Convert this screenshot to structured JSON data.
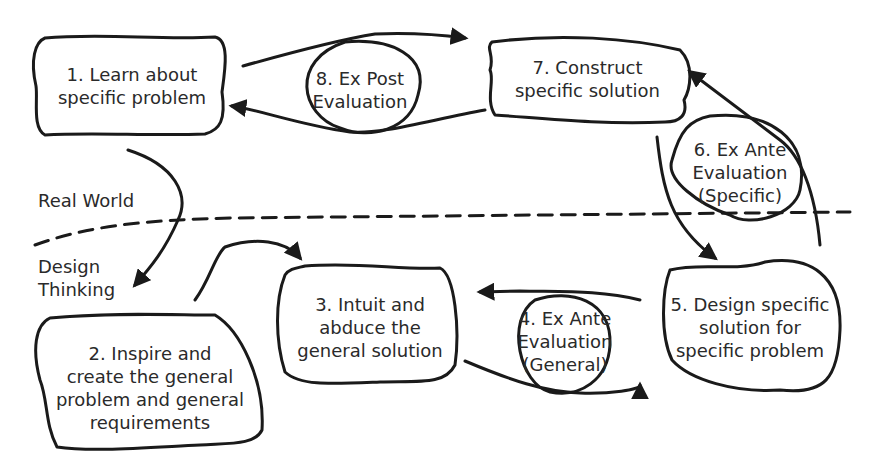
{
  "diagram": {
    "zones": {
      "upper": "Real World",
      "lower": "Design\nThinking"
    },
    "nodes": [
      {
        "id": "n1",
        "shape": "rounded-box",
        "label": "1. Learn about\nspecific problem"
      },
      {
        "id": "n2",
        "shape": "rounded-box",
        "label": "2. Inspire and\ncreate the general\nproblem and general\nrequirements"
      },
      {
        "id": "n3",
        "shape": "rounded-box",
        "label": "3. Intuit and\nabduce the\ngeneral solution"
      },
      {
        "id": "n4",
        "shape": "circle",
        "label": "4. Ex Ante\nEvaluation\n(General)"
      },
      {
        "id": "n5",
        "shape": "blob",
        "label": "5. Design specific\nsolution for\nspecific problem"
      },
      {
        "id": "n6",
        "shape": "circle",
        "label": "6. Ex Ante\nEvaluation\n(Specific)"
      },
      {
        "id": "n7",
        "shape": "rounded-box",
        "label": "7. Construct\nspecific solution"
      },
      {
        "id": "n8",
        "shape": "circle",
        "label": "8. Ex Post\nEvaluation"
      }
    ],
    "edges": [
      {
        "from": "n1",
        "to": "n2"
      },
      {
        "from": "n2",
        "to": "n3"
      },
      {
        "from": "n3",
        "to": "n5",
        "via": "n4"
      },
      {
        "from": "n5",
        "to": "n3",
        "via": "n4"
      },
      {
        "from": "n5",
        "to": "n7",
        "via": "n6"
      },
      {
        "from": "n7",
        "to": "n5",
        "via": "n6"
      },
      {
        "from": "n1",
        "to": "n7",
        "via": "n8"
      },
      {
        "from": "n7",
        "to": "n1",
        "via": "n8"
      }
    ],
    "colors": {
      "ink": "#1a1a1a",
      "text": "#2a2a2a",
      "background": "#ffffff"
    }
  }
}
